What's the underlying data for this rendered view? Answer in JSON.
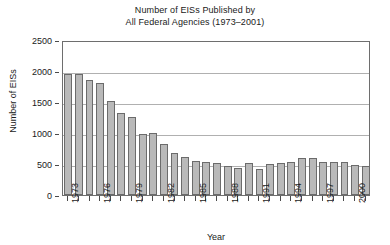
{
  "chart_data": {
    "type": "bar",
    "title": "Number of EISs Published by All Federal Agencies (1973–2001)",
    "title_lines": [
      "Number of EISs Published by",
      "All Federal Agencies (1973–2001)"
    ],
    "xlabel": "Year",
    "ylabel": "Number of EISs",
    "ylim": [
      0,
      2500
    ],
    "ytick_labels": [
      "0",
      "500",
      "1000",
      "1500",
      "2000",
      "2500"
    ],
    "ytick_values": [
      0,
      500,
      1000,
      1500,
      2000,
      2500
    ],
    "xtick_labels": [
      "1973",
      "1976",
      "1979",
      "1982",
      "1985",
      "1988",
      "1991",
      "1994",
      "1997",
      "2000"
    ],
    "xtick_values": [
      1973,
      1976,
      1979,
      1982,
      1985,
      1988,
      1991,
      1994,
      1997,
      2000
    ],
    "grid": "horizontal",
    "legend": "none",
    "bar_color": "#b9b9b9",
    "bar_edge_color": "#6b6b6b",
    "categories": [
      1973,
      1974,
      1975,
      1976,
      1977,
      1978,
      1979,
      1980,
      1981,
      1982,
      1983,
      1984,
      1985,
      1986,
      1987,
      1988,
      1989,
      1990,
      1991,
      1992,
      1993,
      1994,
      1995,
      1996,
      1997,
      1998,
      1999,
      2000,
      2001
    ],
    "values": [
      1950,
      1950,
      1850,
      1800,
      1520,
      1320,
      1260,
      980,
      1000,
      820,
      680,
      620,
      550,
      530,
      520,
      470,
      440,
      510,
      420,
      500,
      510,
      530,
      600,
      600,
      530,
      530,
      530,
      490,
      470
    ]
  }
}
